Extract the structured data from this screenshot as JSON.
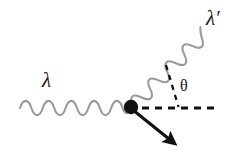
{
  "figure": {
    "name": "compton-scattering-diagram",
    "background_color": "#ffffff",
    "width": 242,
    "height": 161
  },
  "labels": {
    "incoming_photon": "λ",
    "outgoing_photon": "λ′",
    "scattering_angle": "θ"
  },
  "colors": {
    "photon_wave": "#9a9a9a",
    "electron_line": "#111111",
    "vertex_dot": "#111111",
    "dashed_axis": "#111111",
    "dashed_angle": "#111111",
    "label_text": "#1a1a1a"
  },
  "elements": {
    "incoming_photon_wave": {
      "name": "incoming-photon-wave",
      "style": "sinusoidal",
      "start": [
        20,
        108
      ],
      "end": [
        131,
        107
      ],
      "periods": 5,
      "amplitude": 7,
      "stroke_width": 2.1
    },
    "outgoing_photon_wave": {
      "name": "outgoing-photon-wave",
      "style": "sinusoidal",
      "start": [
        133,
        104
      ],
      "end": [
        207,
        30
      ],
      "periods": 4,
      "amplitude": 7,
      "stroke_width": 2.1
    },
    "electron_arrow": {
      "name": "recoil-electron-arrow",
      "start": [
        133,
        110
      ],
      "end": [
        180,
        148
      ],
      "stroke_width": 3,
      "arrowhead": true
    },
    "vertex": {
      "name": "interaction-vertex-dot",
      "center": [
        131,
        107
      ],
      "radius": 7
    },
    "reference_axis": {
      "name": "horizontal-reference-axis",
      "start": [
        142,
        108
      ],
      "end": [
        214,
        108
      ],
      "dash": "7 6",
      "stroke_width": 3
    },
    "angle_guide": {
      "name": "angle-guide-line",
      "start": [
        166,
        66
      ],
      "end": [
        178,
        107
      ],
      "dash": "5 5",
      "stroke_width": 2.2
    }
  }
}
